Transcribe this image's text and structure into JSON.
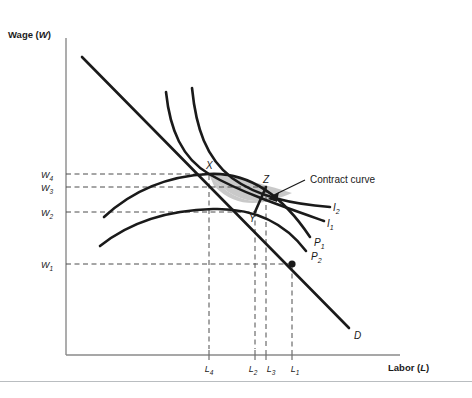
{
  "figure": {
    "axes": {
      "y_title_prefix": "Wage (",
      "y_title_var": "W",
      "y_title_suffix": ")",
      "x_title_prefix": "Labor (",
      "x_title_var": "L",
      "x_title_suffix": ")"
    },
    "y_ticks": [
      {
        "base": "W",
        "sub": "4",
        "value_y": 174
      },
      {
        "base": "W",
        "sub": "3",
        "value_y": 187
      },
      {
        "base": "W",
        "sub": "2",
        "value_y": 212
      },
      {
        "base": "W",
        "sub": "1",
        "value_y": 264
      }
    ],
    "x_ticks": [
      {
        "base": "L",
        "sub": "4",
        "value_x": 209
      },
      {
        "base": "L",
        "sub": "2",
        "value_x": 255
      },
      {
        "base": "L",
        "sub": "3",
        "value_x": 266
      },
      {
        "base": "L",
        "sub": "1",
        "value_x": 292
      }
    ],
    "points": [
      {
        "label": "X",
        "x": 209,
        "y": 174
      },
      {
        "label": "Z",
        "x": 266,
        "y": 187
      },
      {
        "label": "Y",
        "x": 255,
        "y": 212
      }
    ],
    "curve_labels": [
      {
        "base": "I",
        "sub": "2",
        "x": 333,
        "y": 208
      },
      {
        "base": "I",
        "sub": "1",
        "x": 327,
        "y": 224
      },
      {
        "base": "P",
        "sub": "1",
        "x": 315,
        "y": 243
      },
      {
        "base": "P",
        "sub": "2",
        "x": 312,
        "y": 257
      },
      {
        "base": "D",
        "sub": "",
        "x": 356,
        "y": 336
      }
    ],
    "annotation": {
      "text": "Contract curve",
      "x": 310,
      "y": 183
    },
    "colors": {
      "curve": "#1a1a1a",
      "shade": "#c9c9c9",
      "dashed": "#4d4d4d",
      "axis": "#808080",
      "rule": "#b9bdc0"
    }
  }
}
